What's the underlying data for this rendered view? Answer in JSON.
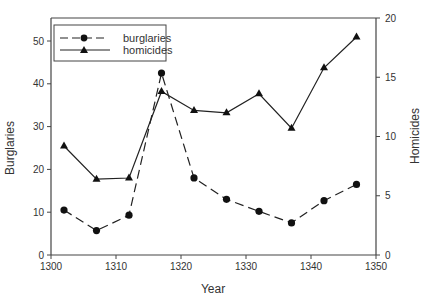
{
  "chart_data": {
    "type": "line",
    "title": "",
    "xlabel": "Year",
    "ylabel": "Burglaries",
    "y2label": "Homicides",
    "xlim": [
      1300,
      1350
    ],
    "ylim": [
      0,
      55
    ],
    "y2lim": [
      0,
      20
    ],
    "xticks": [
      1300,
      1310,
      1320,
      1330,
      1340,
      1350
    ],
    "yticks": [
      0,
      10,
      20,
      30,
      40,
      50
    ],
    "y2ticks": [
      0,
      5,
      10,
      15,
      20
    ],
    "grid": false,
    "legend_position": "upper left",
    "x": [
      1302,
      1307,
      1312,
      1317,
      1322,
      1327,
      1332,
      1337,
      1342,
      1347
    ],
    "series": [
      {
        "name": "burglaries",
        "axis": "left",
        "marker": "circle",
        "line_style": "dashed",
        "values": [
          10.5,
          5.7,
          9.3,
          42.5,
          18.0,
          13.0,
          10.2,
          7.5,
          12.7,
          16.5
        ]
      },
      {
        "name": "homicides",
        "axis": "right",
        "marker": "triangle",
        "line_style": "solid",
        "values": [
          9.2,
          6.4,
          6.5,
          13.8,
          12.2,
          12.0,
          13.6,
          10.7,
          15.8,
          18.4
        ]
      }
    ]
  },
  "legend": {
    "burglaries": "burglaries",
    "homicides": "homicides"
  },
  "axes": {
    "xlabel": "Year",
    "ylabel": "Burglaries",
    "y2label": "Homicides"
  }
}
